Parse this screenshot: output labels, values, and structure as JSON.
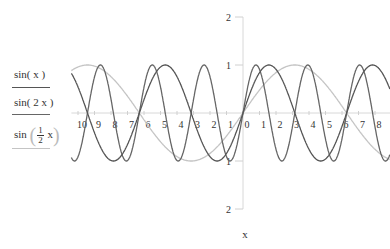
{
  "chart_data": {
    "type": "line",
    "title": "",
    "xlabel": "x",
    "ylabel": "",
    "xlim": [
      -10.4,
      8.9
    ],
    "ylim": [
      -2.0,
      2.0
    ],
    "grid": false,
    "legend_position": "left",
    "x_tick_labels": [
      "10",
      "9",
      "8",
      "7",
      "6",
      "5",
      "4",
      "3",
      "2",
      "1",
      "0",
      "1",
      "2",
      "3",
      "4",
      "5",
      "6",
      "7",
      "8"
    ],
    "x_tick_values": [
      -10,
      -9,
      -8,
      -7,
      -6,
      -5,
      -4,
      -3,
      -2,
      -1,
      0,
      1,
      2,
      3,
      4,
      5,
      6,
      7,
      8
    ],
    "y_tick_labels": [
      "2",
      "1",
      "1",
      "2"
    ],
    "y_tick_values": [
      2,
      1,
      -1,
      -2
    ],
    "series": [
      {
        "name": "sin(x)",
        "function": "sin(x)",
        "color": "#555555",
        "width": 1.3
      },
      {
        "name": "sin(2 x)",
        "function": "sin(2x)",
        "color": "#666666",
        "width": 1.3
      },
      {
        "name": "sin(1/2 x)",
        "function": "sin(x/2)",
        "color": "#c4c4c4",
        "width": 1.3
      }
    ]
  },
  "legend": {
    "items": [
      {
        "label": "sin( x )"
      },
      {
        "prefix": "sin",
        "num": "1",
        "den": "2",
        "suffix": "x"
      },
      {
        "label": "sin( 2 x )"
      }
    ]
  },
  "layout": {
    "origin_px": [
      243,
      113
    ],
    "px_per_x": 16.5,
    "px_per_y": 48
  }
}
